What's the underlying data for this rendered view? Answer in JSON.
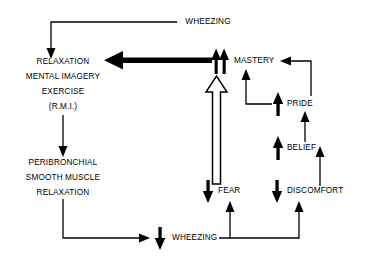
{
  "diagram": {
    "type": "flow-diagram",
    "colors": {
      "line": "#000000",
      "text": "#000000",
      "background": "#ffffff",
      "hollow_fill": "#ffffff"
    },
    "nodes": [
      {
        "id": "wheezing-top",
        "label": "WHEEZING",
        "x": 208,
        "y": 22,
        "align": "middle",
        "indicator": "none"
      },
      {
        "id": "rmi-line1",
        "label": "RELAXATION",
        "x": 63,
        "y": 62,
        "align": "middle",
        "indicator": "none"
      },
      {
        "id": "rmi-line2",
        "label": "MENTAL IMAGERY",
        "x": 63,
        "y": 78,
        "align": "middle",
        "indicator": "none"
      },
      {
        "id": "rmi-line3",
        "label": "EXERCISE",
        "x": 63,
        "y": 93,
        "align": "middle",
        "indicator": "none"
      },
      {
        "id": "rmi-line4",
        "label": "(R.M.I.)",
        "x": 63,
        "y": 108,
        "align": "middle",
        "indicator": "none"
      },
      {
        "id": "peri-line1",
        "label": "PERIBRONCHIAL",
        "x": 63,
        "y": 163,
        "align": "middle",
        "indicator": "none"
      },
      {
        "id": "peri-line2",
        "label": "SMOOTH MUSCLE",
        "x": 63,
        "y": 178,
        "align": "middle",
        "indicator": "none"
      },
      {
        "id": "peri-line3",
        "label": "RELAXATION",
        "x": 63,
        "y": 193,
        "align": "middle",
        "indicator": "none"
      },
      {
        "id": "wheezing-bottom",
        "label": "WHEEZING",
        "x": 172,
        "y": 238,
        "align": "start",
        "indicator": "down"
      },
      {
        "id": "mastery",
        "label": "MASTERY",
        "x": 234,
        "y": 61,
        "align": "start",
        "indicator": "double-up"
      },
      {
        "id": "pride",
        "label": "PRIDE",
        "x": 287,
        "y": 104,
        "align": "start",
        "indicator": "up"
      },
      {
        "id": "belief",
        "label": "BELIEF",
        "x": 287,
        "y": 148,
        "align": "start",
        "indicator": "up"
      },
      {
        "id": "fear",
        "label": "FEAR",
        "x": 218,
        "y": 191,
        "align": "start",
        "indicator": "down"
      },
      {
        "id": "discomfort",
        "label": "DISCOMFORT",
        "x": 287,
        "y": 191,
        "align": "start",
        "indicator": "down"
      }
    ],
    "edges": [
      {
        "id": "edge-wheezing-to-rmi",
        "from": "wheezing-top",
        "to": "rmi",
        "style": "thin"
      },
      {
        "id": "edge-rmi-to-peribronchial",
        "from": "rmi",
        "to": "peribronchial",
        "style": "thin"
      },
      {
        "id": "edge-peribronchial-to-wheezing",
        "from": "peribronchial",
        "to": "wheezing-bottom",
        "style": "thin"
      },
      {
        "id": "edge-mastery-to-rmi",
        "from": "mastery",
        "to": "rmi",
        "style": "thick-black"
      },
      {
        "id": "edge-fear-to-mastery",
        "from": "fear",
        "to": "mastery",
        "style": "hollow-outline"
      },
      {
        "id": "edge-pride-to-mastery-right",
        "from": "pride",
        "to": "mastery",
        "style": "thin"
      },
      {
        "id": "edge-pride-to-mastery-left",
        "from": "pride-arrow",
        "to": "mastery",
        "style": "thin"
      },
      {
        "id": "edge-belief-to-pride",
        "from": "belief",
        "to": "pride",
        "style": "thin"
      },
      {
        "id": "edge-discomfort-to-belief",
        "from": "discomfort",
        "to": "belief",
        "style": "thin"
      },
      {
        "id": "edge-wheezing-to-fear",
        "from": "wheezing-bottom",
        "to": "fear",
        "style": "thin"
      },
      {
        "id": "edge-wheezing-to-discomfort",
        "from": "wheezing-bottom",
        "to": "discomfort",
        "style": "thin"
      }
    ]
  }
}
